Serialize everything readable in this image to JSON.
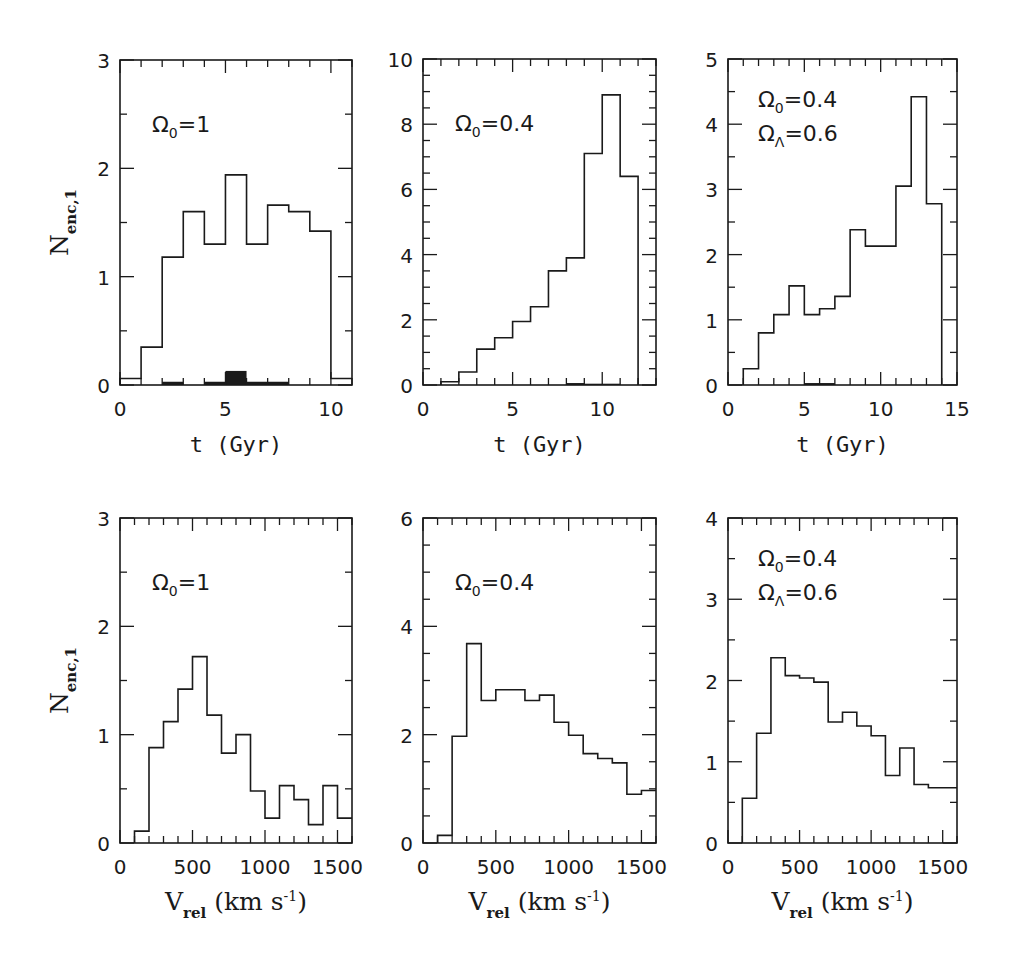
{
  "figure": {
    "background": "#ffffff",
    "ink_color": "#1a1a1a"
  },
  "chart_data": [
    {
      "id": "top-left",
      "type": "bar",
      "histogram": true,
      "annotation": [
        "Ω₀=1"
      ],
      "annotation_parts": [
        {
          "base": "Ω",
          "sub": "0",
          "rest": "=1"
        }
      ],
      "xlabel": "t (Gyr)",
      "ylabel": "N_enc,1",
      "xlim": [
        0,
        11
      ],
      "ylim": [
        0,
        3
      ],
      "xticks_major": [
        0,
        5,
        10
      ],
      "xticks_minor_step": 1,
      "yticks_major": [
        0,
        1,
        2,
        3
      ],
      "yticks_minor_step": 0.5,
      "bin_edges": [
        0,
        1,
        2,
        3,
        4,
        5,
        6,
        7,
        8,
        9,
        10,
        11
      ],
      "series": [
        {
          "name": "all encounters",
          "style": "step",
          "values": [
            0.06,
            0.35,
            1.18,
            1.6,
            1.3,
            1.94,
            1.3,
            1.66,
            1.6,
            1.42,
            0.06
          ]
        },
        {
          "name": "filled subset",
          "style": "filled",
          "values": [
            0,
            0,
            0.03,
            0,
            0.03,
            0.13,
            0.03,
            0.03,
            0,
            0,
            0
          ]
        }
      ],
      "frame": {
        "x": 120,
        "y": 60,
        "w": 232,
        "h": 325
      }
    },
    {
      "id": "top-middle",
      "type": "bar",
      "histogram": true,
      "annotation_parts": [
        {
          "base": "Ω",
          "sub": "0",
          "rest": "=0.4"
        }
      ],
      "xlabel": "t (Gyr)",
      "ylabel": "",
      "xlim": [
        0,
        13
      ],
      "ylim": [
        0,
        10
      ],
      "xticks_major": [
        0,
        5,
        10
      ],
      "xticks_minor_step": 1,
      "yticks_major": [
        0,
        2,
        4,
        6,
        8,
        10
      ],
      "yticks_minor_step": 0.5,
      "bin_edges": [
        1,
        2,
        3,
        4,
        5,
        6,
        7,
        8,
        9,
        10,
        11,
        12
      ],
      "series": [
        {
          "name": "all encounters",
          "style": "step",
          "values": [
            0.1,
            0.4,
            1.1,
            1.45,
            1.95,
            2.4,
            3.5,
            3.9,
            7.1,
            8.9,
            6.4
          ]
        },
        {
          "name": "filled subset",
          "style": "filled",
          "values": [
            0,
            0,
            0,
            0,
            0,
            0,
            0,
            0.06,
            0.04,
            0.04,
            0
          ]
        }
      ],
      "frame": {
        "x": 423,
        "y": 59,
        "w": 233,
        "h": 326
      }
    },
    {
      "id": "top-right",
      "type": "bar",
      "histogram": true,
      "annotation_parts": [
        {
          "base": "Ω",
          "sub": "0",
          "rest": "=0.4"
        },
        {
          "base": "Ω",
          "sub": "Λ",
          "rest": "=0.6"
        }
      ],
      "xlabel": "t (Gyr)",
      "ylabel": "",
      "xlim": [
        0,
        15
      ],
      "ylim": [
        0,
        5
      ],
      "xticks_major": [
        0,
        5,
        10,
        15
      ],
      "xticks_minor_step": 1,
      "yticks_major": [
        0,
        1,
        2,
        3,
        4,
        5
      ],
      "yticks_minor_step": 0.5,
      "bin_edges": [
        1,
        2,
        3,
        4,
        5,
        6,
        7,
        8,
        9,
        10,
        11,
        12,
        13,
        14
      ],
      "series": [
        {
          "name": "all encounters",
          "style": "step",
          "values": [
            0.25,
            0.8,
            1.08,
            1.52,
            1.08,
            1.17,
            1.36,
            2.38,
            2.13,
            2.13,
            3.05,
            4.42,
            2.78
          ]
        },
        {
          "name": "filled subset",
          "style": "filled",
          "values": [
            0,
            0,
            0,
            0,
            0.03,
            0.03,
            0,
            0,
            0,
            0,
            0,
            0,
            0
          ]
        }
      ],
      "frame": {
        "x": 728,
        "y": 59,
        "w": 229,
        "h": 326
      }
    },
    {
      "id": "bottom-left",
      "type": "bar",
      "histogram": true,
      "annotation_parts": [
        {
          "base": "Ω",
          "sub": "0",
          "rest": "=1"
        }
      ],
      "xlabel": "V_rel (km s^-1)",
      "ylabel": "N_enc,1",
      "xlim": [
        0,
        1600
      ],
      "ylim": [
        0,
        3
      ],
      "xticks_major": [
        0,
        500,
        1000,
        1500
      ],
      "xticks_minor_step": 100,
      "yticks_major": [
        0,
        1,
        2,
        3
      ],
      "yticks_minor_step": 0.5,
      "bin_edges": [
        100,
        200,
        300,
        400,
        500,
        600,
        700,
        800,
        900,
        1000,
        1100,
        1200,
        1300,
        1400,
        1500,
        1600
      ],
      "series": [
        {
          "name": "all encounters",
          "style": "step",
          "values": [
            0.11,
            0.88,
            1.12,
            1.42,
            1.72,
            1.18,
            0.83,
            1.0,
            0.48,
            0.23,
            0.53,
            0.4,
            0.17,
            0.53,
            0.23
          ]
        }
      ],
      "frame": {
        "x": 120,
        "y": 518,
        "w": 232,
        "h": 325
      }
    },
    {
      "id": "bottom-middle",
      "type": "bar",
      "histogram": true,
      "annotation_parts": [
        {
          "base": "Ω",
          "sub": "0",
          "rest": "=0.4"
        }
      ],
      "xlabel": "V_rel (km s^-1)",
      "ylabel": "",
      "xlim": [
        0,
        1600
      ],
      "ylim": [
        0,
        6
      ],
      "xticks_major": [
        0,
        500,
        1000,
        1500
      ],
      "xticks_minor_step": 100,
      "yticks_major": [
        0,
        2,
        4,
        6
      ],
      "yticks_minor_step": 0.5,
      "bin_edges": [
        100,
        200,
        300,
        400,
        500,
        600,
        700,
        800,
        900,
        1000,
        1100,
        1200,
        1300,
        1400,
        1500,
        1600
      ],
      "series": [
        {
          "name": "all encounters",
          "style": "step",
          "values": [
            0.14,
            1.97,
            3.68,
            2.63,
            2.83,
            2.83,
            2.63,
            2.73,
            2.23,
            1.99,
            1.65,
            1.56,
            1.48,
            0.9,
            0.97
          ]
        }
      ],
      "frame": {
        "x": 423,
        "y": 518,
        "w": 233,
        "h": 325
      }
    },
    {
      "id": "bottom-right",
      "type": "bar",
      "histogram": true,
      "annotation_parts": [
        {
          "base": "Ω",
          "sub": "0",
          "rest": "=0.4"
        },
        {
          "base": "Ω",
          "sub": "Λ",
          "rest": "=0.6"
        }
      ],
      "xlabel": "V_rel (km s^-1)",
      "ylabel": "",
      "xlim": [
        0,
        1600
      ],
      "ylim": [
        0,
        4
      ],
      "xticks_major": [
        0,
        500,
        1000,
        1500
      ],
      "xticks_minor_step": 100,
      "yticks_major": [
        0,
        1,
        2,
        3,
        4
      ],
      "yticks_minor_step": 0.5,
      "bin_edges": [
        100,
        200,
        300,
        400,
        500,
        600,
        700,
        800,
        900,
        1000,
        1100,
        1200,
        1300,
        1400,
        1500,
        1600
      ],
      "series": [
        {
          "name": "all encounters",
          "style": "step",
          "values": [
            0.55,
            1.35,
            2.28,
            2.06,
            2.03,
            1.98,
            1.49,
            1.61,
            1.44,
            1.32,
            0.83,
            1.17,
            0.72,
            0.68,
            0.68
          ]
        }
      ],
      "frame": {
        "x": 728,
        "y": 518,
        "w": 229,
        "h": 325
      }
    }
  ],
  "axis_label_parts": {
    "t": {
      "main": "t (Gyr)"
    },
    "vrel": {
      "main": "V",
      "sub": "rel",
      "rest": " (km s",
      "sup": "-1",
      "end": ")"
    },
    "nenc": {
      "main": "N",
      "sub": "enc,1"
    }
  }
}
